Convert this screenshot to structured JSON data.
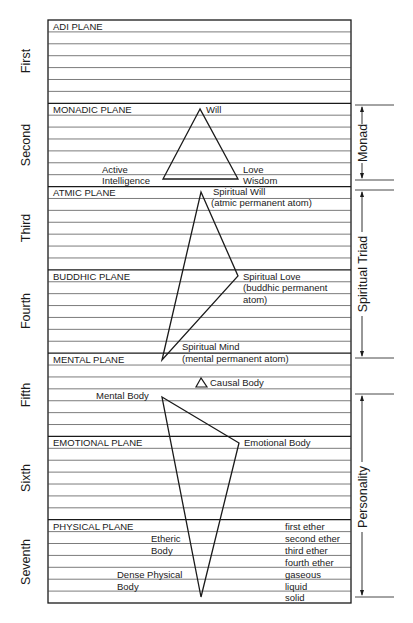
{
  "colors": {
    "ink": "#1a1a1a",
    "background": "#ffffff",
    "gridline": "#444444"
  },
  "layout": {
    "box_left": 48,
    "box_right": 351,
    "box_top": 20,
    "box_bottom": 603,
    "rows": 49
  },
  "planes": [
    {
      "number": "First",
      "name": "ADI PLANE"
    },
    {
      "number": "Second",
      "name": "MONADIC PLANE"
    },
    {
      "number": "Third",
      "name": "ATMIC PLANE"
    },
    {
      "number": "Fourth",
      "name": "BUDDHIC PLANE"
    },
    {
      "number": "Fifth",
      "name": "MENTAL PLANE"
    },
    {
      "number": "Sixth",
      "name": "EMOTIONAL PLANE"
    },
    {
      "number": "Seventh",
      "name": "PHYSICAL PLANE"
    }
  ],
  "monad_triangle": {
    "will": "Will",
    "active_intelligence": [
      "Active",
      "Intelligence"
    ],
    "love_wisdom": [
      "Love",
      "Wisdom"
    ]
  },
  "triad_triangle": {
    "spiritual_will": [
      "Spiritual Will",
      "(atmic permanent atom)"
    ],
    "spiritual_love": [
      "Spiritual Love",
      "(buddhic permanent",
      "atom)"
    ],
    "spiritual_mind": [
      "Spiritual Mind",
      "(mental permanent atom)"
    ]
  },
  "causal_body": "Causal Body",
  "personality_triangle": {
    "mental_body": "Mental Body",
    "emotional_body": "Emotional Body",
    "etheric_body": [
      "Etheric",
      "Body"
    ],
    "dense_physical_body": [
      "Dense Physical",
      "Body"
    ]
  },
  "physical_subplanes": [
    "first ether",
    "second ether",
    "third ether",
    "fourth ether",
    "gaseous",
    "liquid",
    "solid"
  ],
  "brackets": {
    "monad": "Monad",
    "spiritual_triad": "Spiritual Triad",
    "personality": "Personality"
  }
}
